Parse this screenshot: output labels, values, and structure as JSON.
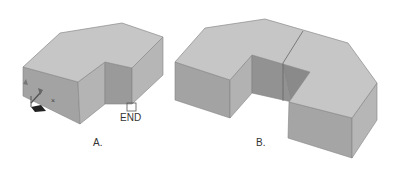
{
  "figure": {
    "colors": {
      "top_face": "#c4c4c4",
      "front_face": "#9e9e9e",
      "side_face": "#b2b2b2",
      "inner_face": "#8e8e8e",
      "edge": "#7a7a7a",
      "background": "#ffffff"
    },
    "panels": [
      {
        "id": "A",
        "caption": "A.",
        "snap_marker_label": "END",
        "ucs_icon_axis_label": "x",
        "description": "Bent L-shaped solid with chamfered back corner, UCS icon at lower-left, endpoint snap marker at lower-right"
      },
      {
        "id": "B",
        "caption": "B.",
        "description": "U-shaped solid formed by mirroring shape A, with seam line where halves join"
      }
    ]
  }
}
